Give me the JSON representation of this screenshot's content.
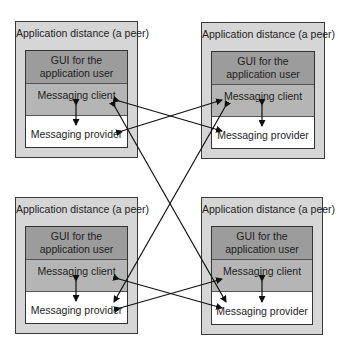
{
  "colors": {
    "frame": "#d6d6d6",
    "gui_band": "#9c9c9c",
    "client_band": "#b5b5b5",
    "provider_band": "#ffffff",
    "arrow": "#111111"
  },
  "peers": [
    {
      "id": "top-left",
      "title": "Application distance (a peer)",
      "gui": "GUI for the application user",
      "client": "Messaging client",
      "provider": "Messaging provider"
    },
    {
      "id": "top-right",
      "title": "Application distance (a peer)",
      "gui": "GUI for the application user",
      "client": "Messaging client",
      "provider": "Messaging provider"
    },
    {
      "id": "bottom-left",
      "title": "Application distance (a peer)",
      "gui": "GUI for the application user",
      "client": "Messaging client",
      "provider": "Messaging provider"
    },
    {
      "id": "bottom-right",
      "title": "Application distance (a peer)",
      "gui": "GUI for the application user",
      "client": "Messaging client",
      "provider": "Messaging provider"
    }
  ],
  "connections": [
    {
      "from": "top-left.client",
      "to": "top-right.provider"
    },
    {
      "from": "top-left.provider",
      "to": "top-right.client"
    },
    {
      "from": "bottom-left.client",
      "to": "bottom-right.provider"
    },
    {
      "from": "bottom-left.provider",
      "to": "bottom-right.client"
    },
    {
      "from": "top-left.client",
      "to": "bottom-right.provider"
    },
    {
      "from": "top-right.client",
      "to": "bottom-left.provider"
    },
    {
      "from": "top-left.client",
      "to": "top-left.provider"
    },
    {
      "from": "top-right.client",
      "to": "top-right.provider"
    },
    {
      "from": "bottom-left.client",
      "to": "bottom-left.provider"
    },
    {
      "from": "bottom-right.client",
      "to": "bottom-right.provider"
    }
  ]
}
